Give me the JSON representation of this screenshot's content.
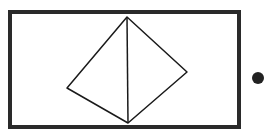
{
  "diagram": {
    "frame": {
      "x": 10,
      "y": 12,
      "width": 229,
      "height": 115,
      "stroke": "#2a2a2a",
      "stroke_width": 4
    },
    "shape": {
      "type": "tetrahedron-outline",
      "stroke": "#1a1a1a",
      "stroke_width": 1.5,
      "vertices": {
        "top": [
          127,
          17
        ],
        "left": [
          67,
          88
        ],
        "bottom": [
          128,
          123
        ],
        "right": [
          187,
          72
        ]
      }
    },
    "dot": {
      "cx": 258,
      "cy": 78,
      "r": 6,
      "fill": "#222222"
    }
  }
}
